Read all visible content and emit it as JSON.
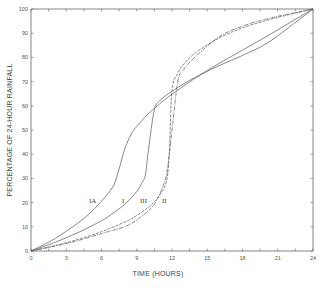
{
  "chart_data": {
    "type": "line",
    "title": "",
    "xlabel": "TIME (HOURS)",
    "ylabel": "PERCENTAGE OF 24-HOUR RAINFALL",
    "xlim": [
      0,
      24
    ],
    "ylim": [
      0,
      100
    ],
    "x_tick_labels": [
      "0",
      "3",
      "6",
      "9",
      "12",
      "15",
      "18",
      "21",
      "24"
    ],
    "x_minor_tick_step": 1.5,
    "y_tick_labels": [
      "0",
      "10",
      "20",
      "30",
      "40",
      "50",
      "60",
      "70",
      "80",
      "90",
      "100"
    ],
    "grid": false,
    "legend": "inline curve labels",
    "series": [
      {
        "name": "IA",
        "style": "solid",
        "x": [
          0,
          2,
          4,
          5,
          6,
          7,
          7.5,
          8,
          8.5,
          9,
          10,
          11,
          12,
          14,
          16,
          18,
          20,
          22,
          24
        ],
        "values": [
          0,
          5,
          11.6,
          15.6,
          20.6,
          26.8,
          34.0,
          42.5,
          48.0,
          51.5,
          56.8,
          61.0,
          64.8,
          71.5,
          77.5,
          83.0,
          88.5,
          94.3,
          100
        ]
      },
      {
        "name": "I",
        "style": "solid",
        "x": [
          0,
          2,
          4,
          6,
          7,
          8,
          9,
          9.5,
          9.75,
          10,
          10.5,
          11,
          11.5,
          12,
          13,
          14,
          16,
          18,
          20,
          22,
          24
        ],
        "values": [
          0,
          3.5,
          7.6,
          12.5,
          15.7,
          19.4,
          24.6,
          28.7,
          31.8,
          42.0,
          58.4,
          62.3,
          64.3,
          66.0,
          69.1,
          71.8,
          76.6,
          80.8,
          85.6,
          92.6,
          100
        ]
      },
      {
        "name": "II",
        "style": "dashed",
        "x": [
          0,
          2,
          4,
          6,
          8,
          9,
          10,
          10.5,
          11,
          11.5,
          11.75,
          12,
          12.5,
          13,
          14,
          16,
          18,
          20,
          22,
          24
        ],
        "values": [
          0,
          2.2,
          4.8,
          8.0,
          12.0,
          14.7,
          18.1,
          20.4,
          23.5,
          28.3,
          38.7,
          66.3,
          73.5,
          77.2,
          81.9,
          88.0,
          92.2,
          95.2,
          97.7,
          100
        ]
      },
      {
        "name": "III",
        "style": "dash-dot",
        "x": [
          0,
          2,
          4,
          6,
          8,
          9,
          10,
          10.5,
          11,
          11.5,
          11.75,
          12,
          12.5,
          13,
          14,
          16,
          18,
          20,
          22,
          24
        ],
        "values": [
          0,
          2.0,
          4.3,
          7.2,
          10.1,
          12.8,
          16.7,
          19.4,
          24.0,
          30.8,
          39.0,
          50.0,
          70.2,
          75.0,
          80.3,
          88.5,
          92.9,
          95.8,
          98.0,
          100
        ]
      }
    ]
  },
  "labels": {
    "xlabel": "TIME (HOURS)",
    "ylabel": "PERCENTAGE OF 24-HOUR RAINFALL",
    "curve_IA": "IA",
    "curve_I": "I",
    "curve_III": "III",
    "curve_II": "II"
  }
}
